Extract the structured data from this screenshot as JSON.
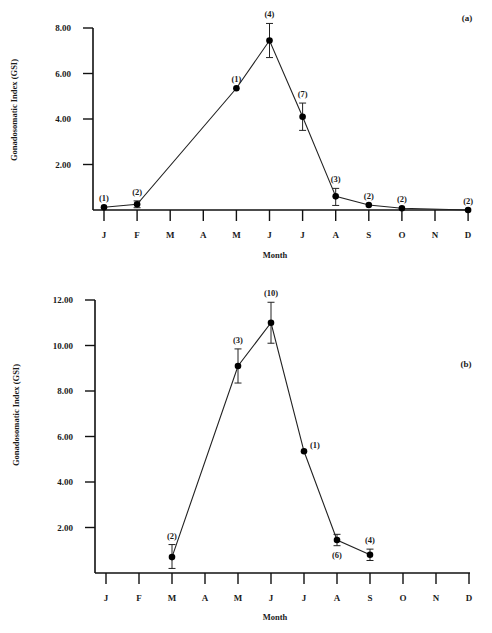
{
  "chart_data": [
    {
      "type": "line",
      "panel_label": "(a)",
      "title": "",
      "xlabel": "Month",
      "ylabel": "Gonadosomatic Index (GSI)",
      "ylim": [
        0,
        8
      ],
      "yticks": [
        "2.00",
        "4.00",
        "6.00",
        "8.00"
      ],
      "ytick_values": [
        2,
        4,
        6,
        8
      ],
      "grid": false,
      "categories": [
        "J",
        "F",
        "M",
        "A",
        "M",
        "J",
        "J",
        "A",
        "S",
        "O",
        "N",
        "D"
      ],
      "series": [
        {
          "name": "GSI",
          "points": [
            {
              "month_index": 0,
              "month": "J",
              "value": 0.12,
              "n": "(1)",
              "err_low": null,
              "err_high": null,
              "label_pos": "above"
            },
            {
              "month_index": 1,
              "month": "F",
              "value": 0.25,
              "n": "(2)",
              "err_low": 0.1,
              "err_high": 0.4,
              "label_pos": "above"
            },
            {
              "month_index": 4,
              "month": "M",
              "value": 5.35,
              "n": "(1)",
              "err_low": null,
              "err_high": null,
              "label_pos": "above"
            },
            {
              "month_index": 5,
              "month": "J",
              "value": 7.45,
              "n": "(4)",
              "err_low": 6.7,
              "err_high": 8.2,
              "label_pos": "above"
            },
            {
              "month_index": 6,
              "month": "J",
              "value": 4.1,
              "n": "(7)",
              "err_low": 3.5,
              "err_high": 4.7,
              "label_pos": "above"
            },
            {
              "month_index": 7,
              "month": "A",
              "value": 0.6,
              "n": "(3)",
              "err_low": 0.2,
              "err_high": 0.95,
              "label_pos": "above"
            },
            {
              "month_index": 8,
              "month": "S",
              "value": 0.22,
              "n": "(2)",
              "err_low": null,
              "err_high": null,
              "label_pos": "above"
            },
            {
              "month_index": 9,
              "month": "O",
              "value": 0.08,
              "n": "(2)",
              "err_low": null,
              "err_high": null,
              "label_pos": "above"
            },
            {
              "month_index": 11,
              "month": "D",
              "value": 0.0,
              "n": "(2)",
              "err_low": null,
              "err_high": null,
              "label_pos": "above"
            }
          ]
        }
      ]
    },
    {
      "type": "line",
      "panel_label": "(b)",
      "title": "",
      "xlabel": "Month",
      "ylabel": "Gonadosomatic Index (GSI)",
      "ylim": [
        0,
        12
      ],
      "yticks": [
        "2.00",
        "4.00",
        "6.00",
        "8.00",
        "10.00",
        "12.00"
      ],
      "ytick_values": [
        2,
        4,
        6,
        8,
        10,
        12
      ],
      "grid": false,
      "categories": [
        "J",
        "F",
        "M",
        "A",
        "M",
        "J",
        "J",
        "A",
        "S",
        "O",
        "N",
        "D"
      ],
      "series": [
        {
          "name": "GSI",
          "points": [
            {
              "month_index": 2,
              "month": "M",
              "value": 0.7,
              "n": "(2)",
              "err_low": 0.2,
              "err_high": 1.25,
              "label_pos": "above"
            },
            {
              "month_index": 4,
              "month": "M",
              "value": 9.1,
              "n": "(3)",
              "err_low": 8.35,
              "err_high": 9.85,
              "label_pos": "above"
            },
            {
              "month_index": 5,
              "month": "J",
              "value": 11.0,
              "n": "(10)",
              "err_low": 10.1,
              "err_high": 11.9,
              "label_pos": "above"
            },
            {
              "month_index": 6,
              "month": "J",
              "value": 5.35,
              "n": "(1)",
              "err_low": null,
              "err_high": null,
              "label_pos": "right"
            },
            {
              "month_index": 7,
              "month": "A",
              "value": 1.45,
              "n": "(6)",
              "err_low": 1.2,
              "err_high": 1.7,
              "label_pos": "below"
            },
            {
              "month_index": 8,
              "month": "S",
              "value": 0.8,
              "n": "(4)",
              "err_low": 0.55,
              "err_high": 1.05,
              "label_pos": "above"
            }
          ]
        }
      ]
    }
  ]
}
